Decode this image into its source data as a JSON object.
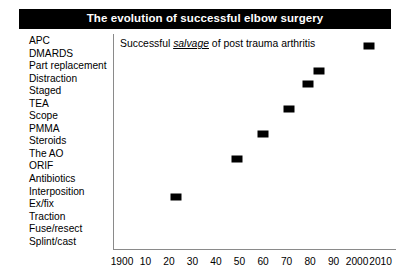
{
  "title": {
    "text": "The evolution of successful elbow surgery"
  },
  "caption": {
    "prefix": "Successful ",
    "emphasis": "salvage",
    "suffix": " of post trauma arthritis"
  },
  "categories": [
    "APC",
    "DMARDS",
    "Part replacement",
    "Distraction",
    "Staged",
    "TEA",
    "Scope",
    "PMMA",
    "Steroids",
    "The AO",
    "ORIF",
    "Antibiotics",
    "Interposition",
    "Ex/fix",
    "Traction",
    "Fuse/resect",
    "Splint/cast"
  ],
  "colors": {
    "title_bar_background": "#000000",
    "title_text": "#ffffff",
    "axis": "#8a8a8a",
    "marker": "#000000",
    "page_background": "#ffffff"
  },
  "chart_data": {
    "type": "scatter",
    "title": "The evolution of successful elbow surgery",
    "annotation": "Successful salvage of post trauma arthritis",
    "xlabel": "",
    "ylabel": "",
    "xlim": [
      1900,
      2014
    ],
    "x_tick_labels": [
      "1900",
      "10",
      "20",
      "30",
      "40",
      "50",
      "60",
      "70",
      "80",
      "90",
      "2000",
      "2010"
    ],
    "x_tick_values": [
      1900,
      1910,
      1920,
      1930,
      1940,
      1950,
      1960,
      1970,
      1980,
      1990,
      2000,
      2010
    ],
    "y_categories": [
      "Splint/cast",
      "Fuse/resect",
      "Traction",
      "Ex/fix",
      "Interposition",
      "Antibiotics",
      "ORIF",
      "The AO",
      "Steroids",
      "PMMA",
      "Scope",
      "TEA",
      "Staged",
      "Distraction",
      "Part replacement",
      "DMARDS",
      "APC"
    ],
    "grid": false,
    "legend": null,
    "points": [
      {
        "x": 1923,
        "y": "Interposition",
        "label": "Interposition"
      },
      {
        "x": 1949,
        "y": "The AO",
        "label": "The AO"
      },
      {
        "x": 1960,
        "y": "PMMA",
        "label": "PMMA"
      },
      {
        "x": 1971,
        "y": "TEA",
        "label": "TEA"
      },
      {
        "x": 1979,
        "y": "Distraction",
        "label": "Distraction"
      },
      {
        "x": 1984,
        "y": "Part replacement",
        "label": "Part replacement"
      },
      {
        "x": 2005,
        "y": "APC",
        "label": "APC"
      }
    ]
  }
}
